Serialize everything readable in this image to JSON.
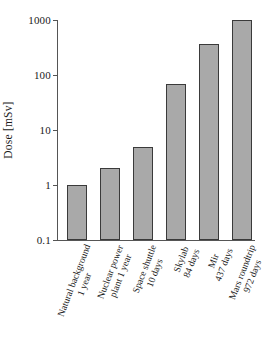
{
  "chart_data": {
    "type": "bar",
    "title": "",
    "subtitle": "",
    "xlabel": "",
    "ylabel": "Dose [mSv]",
    "yscale": "log",
    "ylim": [
      0.1,
      1000
    ],
    "ytick_labels": [
      "1000",
      "100",
      "10",
      "1",
      "0.1"
    ],
    "ytick_values": [
      1000,
      100,
      10,
      1,
      0.1
    ],
    "grid": false,
    "legend": "none",
    "bar_fill_color": "#a9a9a9",
    "bar_edge_color": "#3a3a3a",
    "background_color": "#ffffff",
    "axis_color": "#555555",
    "categories": [
      "Natural background 1 year",
      "Nuclear power plant 1 year",
      "Space shuttle 10 days",
      "Skylab 84 days",
      "Mir 437 days",
      "Mars roundtrip 972 days"
    ],
    "category_lines": [
      [
        "Natural background",
        "1 year"
      ],
      [
        "Nuclear power",
        "plant 1 year"
      ],
      [
        "Space shuttle",
        "10 days"
      ],
      [
        "Skylab",
        "84 days"
      ],
      [
        "Mir",
        "437 days"
      ],
      [
        "Mars roundtrip",
        "972 days"
      ]
    ],
    "values": [
      1,
      2,
      5,
      70,
      370,
      1000
    ],
    "units": "mSv"
  }
}
